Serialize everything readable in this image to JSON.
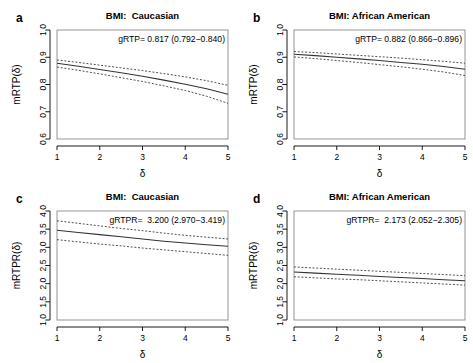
{
  "figure": {
    "panel_letters": [
      "a",
      "b",
      "c",
      "d"
    ]
  },
  "chart_data": [
    {
      "panel": "a",
      "letter": "a",
      "type": "line",
      "title": "BMI:  Caucasian",
      "xlabel": "δ",
      "ylabel": "mRTP(δ)",
      "annotation": "gRTP= 0.817 (0.792−0.840)",
      "estimate": 0.817,
      "ci_low": 0.792,
      "ci_high": 0.84,
      "xlim": [
        1,
        5
      ],
      "ylim": [
        0.6,
        1.0
      ],
      "xticks": [
        1,
        2,
        3,
        4,
        5
      ],
      "xtick_labels": [
        "1",
        "2",
        "3",
        "4",
        "5"
      ],
      "yticks": [
        0.6,
        0.7,
        0.8,
        0.9,
        1.0
      ],
      "ytick_labels": [
        "0.6",
        "0.7",
        "0.8",
        "0.9",
        "1.0"
      ],
      "grid": false,
      "legend": "none",
      "x": [
        1,
        1.5,
        2,
        2.5,
        3,
        3.5,
        4,
        4.5,
        5
      ],
      "series": [
        {
          "name": "mRTP estimate",
          "style": "solid",
          "values": [
            0.878,
            0.867,
            0.855,
            0.843,
            0.83,
            0.816,
            0.801,
            0.784,
            0.764
          ]
        },
        {
          "name": "upper 95% CI",
          "style": "dashed",
          "values": [
            0.89,
            0.881,
            0.871,
            0.861,
            0.851,
            0.84,
            0.828,
            0.814,
            0.797
          ]
        },
        {
          "name": "lower 95% CI",
          "style": "dashed",
          "values": [
            0.864,
            0.852,
            0.839,
            0.825,
            0.811,
            0.795,
            0.778,
            0.757,
            0.731
          ]
        }
      ]
    },
    {
      "panel": "b",
      "letter": "b",
      "type": "line",
      "title": "BMI: African American",
      "xlabel": "δ",
      "ylabel": "mRTP(δ)",
      "annotation": "gRTP= 0.882 (0.866−0.896)",
      "estimate": 0.882,
      "ci_low": 0.866,
      "ci_high": 0.896,
      "xlim": [
        1,
        5
      ],
      "ylim": [
        0.6,
        1.0
      ],
      "xticks": [
        1,
        2,
        3,
        4,
        5
      ],
      "xtick_labels": [
        "1",
        "2",
        "3",
        "4",
        "5"
      ],
      "yticks": [
        0.6,
        0.7,
        0.8,
        0.9,
        1.0
      ],
      "ytick_labels": [
        "0.6",
        "0.7",
        "0.8",
        "0.9",
        "1.0"
      ],
      "grid": false,
      "legend": "none",
      "x": [
        1,
        1.5,
        2,
        2.5,
        3,
        3.5,
        4,
        4.5,
        5
      ],
      "series": [
        {
          "name": "mRTP estimate",
          "style": "solid",
          "values": [
            0.911,
            0.906,
            0.9,
            0.894,
            0.888,
            0.881,
            0.874,
            0.866,
            0.856
          ]
        },
        {
          "name": "upper 95% CI",
          "style": "dashed",
          "values": [
            0.921,
            0.917,
            0.912,
            0.907,
            0.902,
            0.897,
            0.891,
            0.885,
            0.878
          ]
        },
        {
          "name": "lower 95% CI",
          "style": "dashed",
          "values": [
            0.901,
            0.895,
            0.888,
            0.881,
            0.873,
            0.865,
            0.856,
            0.846,
            0.833
          ]
        }
      ]
    },
    {
      "panel": "c",
      "letter": "c",
      "type": "line",
      "title": "BMI:  Caucasian",
      "xlabel": "δ",
      "ylabel": "mRTPR(δ)",
      "annotation": "gRTPR=  3.200 (2.970−3.419)",
      "estimate": 3.2,
      "ci_low": 2.97,
      "ci_high": 3.419,
      "xlim": [
        1,
        5
      ],
      "ylim": [
        1.0,
        4.0
      ],
      "xticks": [
        1,
        2,
        3,
        4,
        5
      ],
      "xtick_labels": [
        "1",
        "2",
        "3",
        "4",
        "5"
      ],
      "yticks": [
        1.0,
        1.5,
        2.0,
        2.5,
        3.0,
        3.5,
        4.0
      ],
      "ytick_labels": [
        "1.0",
        "1.5",
        "2.0",
        "2.5",
        "3.0",
        "3.5",
        "4.0"
      ],
      "grid": false,
      "legend": "none",
      "x": [
        1,
        1.5,
        2,
        2.5,
        3,
        3.5,
        4,
        4.5,
        5
      ],
      "series": [
        {
          "name": "mRTPR estimate",
          "style": "solid",
          "values": [
            3.47,
            3.41,
            3.35,
            3.29,
            3.23,
            3.17,
            3.12,
            3.07,
            3.03
          ]
        },
        {
          "name": "upper 95% CI",
          "style": "dashed",
          "values": [
            3.73,
            3.66,
            3.59,
            3.52,
            3.46,
            3.39,
            3.33,
            3.28,
            3.23
          ]
        },
        {
          "name": "lower 95% CI",
          "style": "dashed",
          "values": [
            3.21,
            3.15,
            3.09,
            3.04,
            2.98,
            2.93,
            2.88,
            2.83,
            2.78
          ]
        }
      ]
    },
    {
      "panel": "d",
      "letter": "d",
      "type": "line",
      "title": "BMI: African American",
      "xlabel": "δ",
      "ylabel": "mRTPR(δ)",
      "annotation": "gRTPR=  2.173 (2.052−2.305)",
      "estimate": 2.173,
      "ci_low": 2.052,
      "ci_high": 2.305,
      "xlim": [
        1,
        5
      ],
      "ylim": [
        1.0,
        4.0
      ],
      "xticks": [
        1,
        2,
        3,
        4,
        5
      ],
      "xtick_labels": [
        "1",
        "2",
        "3",
        "4",
        "5"
      ],
      "yticks": [
        1.0,
        1.5,
        2.0,
        2.5,
        3.0,
        3.5,
        4.0
      ],
      "ytick_labels": [
        "1.0",
        "1.5",
        "2.0",
        "2.5",
        "3.0",
        "3.5",
        "4.0"
      ],
      "grid": false,
      "legend": "none",
      "x": [
        1,
        1.5,
        2,
        2.5,
        3,
        3.5,
        4,
        4.5,
        5
      ],
      "series": [
        {
          "name": "mRTPR estimate",
          "style": "solid",
          "values": [
            2.32,
            2.29,
            2.26,
            2.23,
            2.2,
            2.17,
            2.14,
            2.11,
            2.08
          ]
        },
        {
          "name": "upper 95% CI",
          "style": "dashed",
          "values": [
            2.46,
            2.43,
            2.4,
            2.37,
            2.34,
            2.31,
            2.28,
            2.25,
            2.22
          ]
        },
        {
          "name": "lower 95% CI",
          "style": "dashed",
          "values": [
            2.19,
            2.16,
            2.13,
            2.11,
            2.08,
            2.05,
            2.02,
            1.99,
            1.96
          ]
        }
      ]
    }
  ]
}
